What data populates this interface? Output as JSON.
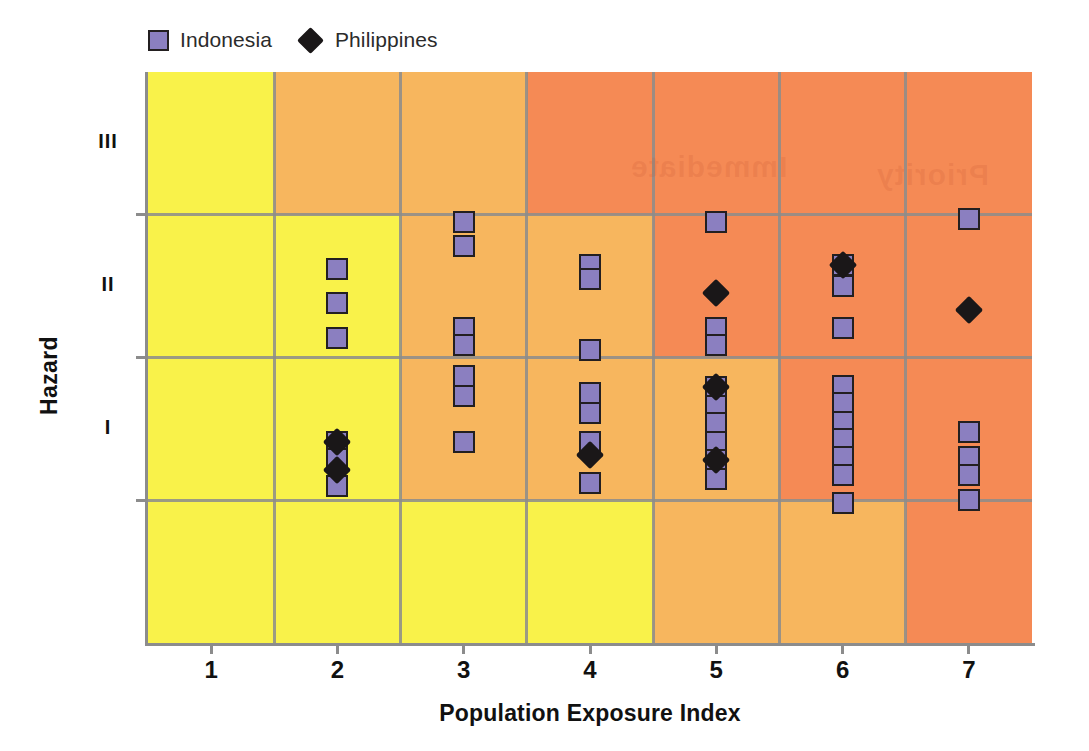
{
  "chart_data": {
    "type": "scatter",
    "title": "",
    "xlabel": "Population Exposure Index",
    "ylabel": "Hazard",
    "xlim": [
      0.5,
      7.5
    ],
    "ylim": [
      0,
      4
    ],
    "x_tick_labels": [
      "1",
      "2",
      "3",
      "4",
      "5",
      "6",
      "7"
    ],
    "x_tick_values": [
      1,
      2,
      3,
      4,
      5,
      6,
      7
    ],
    "y_tick_labels": [
      "I",
      "II",
      "III"
    ],
    "y_tick_values": [
      1,
      2,
      3
    ],
    "grid": true,
    "legend_position": "top-left",
    "series": [
      {
        "name": "Indonesia",
        "marker": "square",
        "color": "#8b7fc0",
        "edge_color": "#231f20",
        "points": [
          {
            "x": 2,
            "y": 2.62
          },
          {
            "x": 2,
            "y": 2.38
          },
          {
            "x": 2,
            "y": 2.14
          },
          {
            "x": 2,
            "y": 1.41
          },
          {
            "x": 2,
            "y": 1.29
          },
          {
            "x": 2,
            "y": 1.1
          },
          {
            "x": 3,
            "y": 2.95
          },
          {
            "x": 3,
            "y": 2.78
          },
          {
            "x": 3,
            "y": 2.21
          },
          {
            "x": 3,
            "y": 2.09
          },
          {
            "x": 3,
            "y": 1.87
          },
          {
            "x": 3,
            "y": 1.73
          },
          {
            "x": 3,
            "y": 1.41
          },
          {
            "x": 4,
            "y": 2.65
          },
          {
            "x": 4,
            "y": 2.55
          },
          {
            "x": 4,
            "y": 2.05
          },
          {
            "x": 4,
            "y": 1.75
          },
          {
            "x": 4,
            "y": 1.61
          },
          {
            "x": 4,
            "y": 1.41
          },
          {
            "x": 4,
            "y": 1.12
          },
          {
            "x": 5,
            "y": 2.95
          },
          {
            "x": 5,
            "y": 2.21
          },
          {
            "x": 5,
            "y": 2.09
          },
          {
            "x": 5,
            "y": 1.79
          },
          {
            "x": 5,
            "y": 1.66
          },
          {
            "x": 5,
            "y": 1.54
          },
          {
            "x": 5,
            "y": 1.41
          },
          {
            "x": 5,
            "y": 1.28
          },
          {
            "x": 5,
            "y": 1.15
          },
          {
            "x": 6,
            "y": 2.65
          },
          {
            "x": 6,
            "y": 2.5
          },
          {
            "x": 6,
            "y": 2.21
          },
          {
            "x": 6,
            "y": 1.8
          },
          {
            "x": 6,
            "y": 1.68
          },
          {
            "x": 6,
            "y": 1.55
          },
          {
            "x": 6,
            "y": 1.43
          },
          {
            "x": 6,
            "y": 1.3
          },
          {
            "x": 6,
            "y": 1.18
          },
          {
            "x": 6,
            "y": 0.98
          },
          {
            "x": 7,
            "y": 2.97
          },
          {
            "x": 7,
            "y": 1.48
          },
          {
            "x": 7,
            "y": 1.3
          },
          {
            "x": 7,
            "y": 1.18
          },
          {
            "x": 7,
            "y": 1.0
          }
        ]
      },
      {
        "name": "Philippines",
        "marker": "diamond",
        "color": "#1a1718",
        "points": [
          {
            "x": 2,
            "y": 1.41
          },
          {
            "x": 2,
            "y": 1.21
          },
          {
            "x": 4,
            "y": 1.32
          },
          {
            "x": 5,
            "y": 2.45
          },
          {
            "x": 5,
            "y": 1.79
          },
          {
            "x": 5,
            "y": 1.28
          },
          {
            "x": 6,
            "y": 2.65
          },
          {
            "x": 7,
            "y": 2.33
          }
        ]
      }
    ],
    "background_bands": {
      "description": "Risk matrix shading from yellow (low) through orange to red-orange (high)",
      "colors": [
        "#f9f24a",
        "#f7b65e",
        "#f58a55",
        "#f47b4f"
      ]
    }
  },
  "legend": {
    "items": [
      {
        "label": "Indonesia",
        "marker": "square-marker"
      },
      {
        "label": "Philippines",
        "marker": "diamond-marker"
      }
    ]
  },
  "axes": {
    "x_title": "Population Exposure Index",
    "y_title": "Hazard",
    "x_ticks": [
      "1",
      "2",
      "3",
      "4",
      "5",
      "6",
      "7"
    ],
    "y_ticks": [
      "III",
      "II",
      "I"
    ]
  },
  "watermark": {
    "text_a": "Immediate",
    "text_b": "Priority"
  }
}
